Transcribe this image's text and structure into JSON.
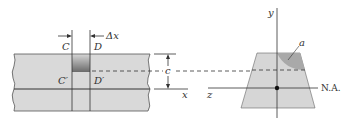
{
  "figure": {
    "type": "beam-bending-shear-diagram",
    "left_panel": {
      "labels": {
        "C": "C",
        "D": "D",
        "C_prime": "C′",
        "D_prime": "D′",
        "delta_x": "Δx",
        "c": "c",
        "x_axis": "x"
      }
    },
    "right_panel": {
      "labels": {
        "y_axis": "y",
        "z_axis": "z",
        "area": "a",
        "neutral_axis": "N.A."
      }
    },
    "colors": {
      "beam_fill": "#d9d9d9",
      "section_fill": "#d6d6d6",
      "shaded_area": "#a9a9a9",
      "line": "#333333"
    }
  }
}
